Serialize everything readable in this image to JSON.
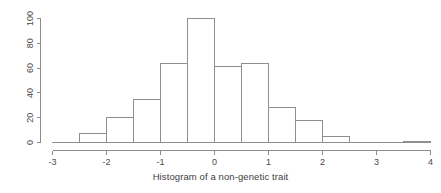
{
  "chart_data": {
    "type": "bar",
    "title": "Histogram of a non-genetic trait",
    "xlabel": "",
    "ylabel": "",
    "xlim": [
      -3,
      4
    ],
    "ylim": [
      0,
      100
    ],
    "grid": false,
    "legend": null,
    "bin_width": 0.5,
    "bin_edges": [
      -3,
      -2.5,
      -2,
      -1.5,
      -1,
      -0.5,
      0,
      0.5,
      1,
      1.5,
      2,
      2.5,
      3,
      3.5,
      4
    ],
    "categories": [
      "-3 to -2.5",
      "-2.5 to -2",
      "-2 to -1.5",
      "-1.5 to -1",
      "-1 to -0.5",
      "-0.5 to 0",
      "0 to 0.5",
      "0.5 to 1",
      "1 to 1.5",
      "1.5 to 2",
      "2 to 2.5",
      "2.5 to 3",
      "3 to 3.5",
      "3.5 to 4"
    ],
    "values": [
      0,
      7,
      20,
      35,
      64,
      100,
      61,
      64,
      28,
      18,
      5,
      0,
      0,
      1
    ],
    "x_ticks": [
      -3,
      -2,
      -1,
      0,
      1,
      2,
      3,
      4
    ],
    "x_tick_labels": [
      "-3",
      "-2",
      "-1",
      "0",
      "1",
      "2",
      "3",
      "4"
    ],
    "y_ticks": [
      0,
      20,
      40,
      60,
      80,
      100
    ],
    "y_tick_labels": [
      "0",
      "20",
      "40",
      "60",
      "80",
      "100"
    ],
    "colors": {
      "bar_stroke": "#8f8f8f",
      "bar_fill": "none",
      "axis": "#8c8c8c",
      "text": "#4a4a4a",
      "background": "#ffffff"
    }
  }
}
